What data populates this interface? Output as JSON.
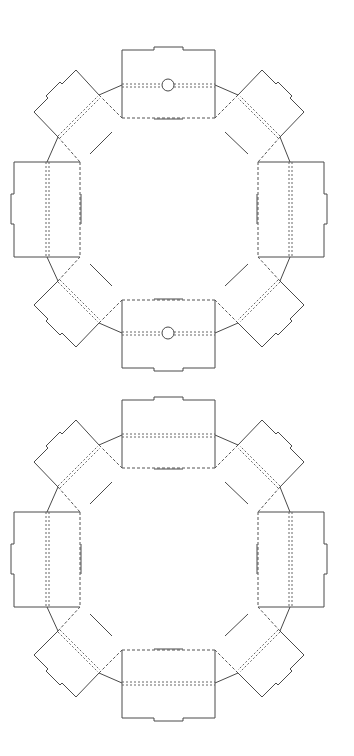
{
  "diagram": {
    "type": "dieline",
    "colors": {
      "background": "#ffffff",
      "line": "#4a4a4a"
    },
    "legend": {
      "solid": "cut line",
      "dashed": "fold line",
      "double_dashed": "score line"
    },
    "templates": [
      {
        "label": "Template with holes",
        "panels": 8,
        "holes": 2,
        "offset_y": 0
      },
      {
        "label": "Template without holes",
        "panels": 8,
        "holes": 0,
        "offset_y": 350
      }
    ]
  }
}
